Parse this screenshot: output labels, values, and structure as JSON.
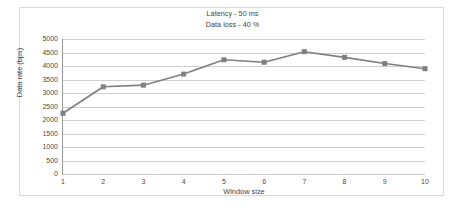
{
  "chart_data": {
    "type": "line",
    "title": "",
    "annotations": [
      "Latency - 50 ms",
      "Data loss - 40 %"
    ],
    "xlabel": "Window size",
    "ylabel": "Data rate (bps)",
    "categories": [
      1,
      2,
      3,
      4,
      5,
      6,
      7,
      8,
      9,
      10
    ],
    "x_tick_labels": [
      "1",
      "2",
      "3",
      "4",
      "5",
      "6",
      "7",
      "8",
      "9",
      "10"
    ],
    "y_tick_labels": [
      "5000",
      "4500",
      "4000",
      "3500",
      "3000",
      "2500",
      "2000",
      "1500",
      "1000",
      "500",
      "0"
    ],
    "y_ticks": [
      0,
      500,
      1000,
      1500,
      2000,
      2500,
      3000,
      3500,
      4000,
      4500,
      5000
    ],
    "ylim": [
      0,
      5000
    ],
    "xlim": [
      1,
      10
    ],
    "grid": "horizontal",
    "legend": "none",
    "series": [
      {
        "name": "Data rate",
        "values": [
          2250,
          3230,
          3290,
          3700,
          4230,
          4140,
          4530,
          4320,
          4090,
          3900
        ],
        "line_color": "#7f7f7f",
        "marker": "square",
        "marker_color": "#808080",
        "marker_size": 5
      }
    ],
    "colors": {
      "line": "#7f7f7f",
      "marker": "#808080",
      "grid": "#d0d0d0",
      "axis": "#9a9a9a",
      "text": "#3f3f3f",
      "frame": "#d9d9d9",
      "background": "#ffffff"
    }
  }
}
